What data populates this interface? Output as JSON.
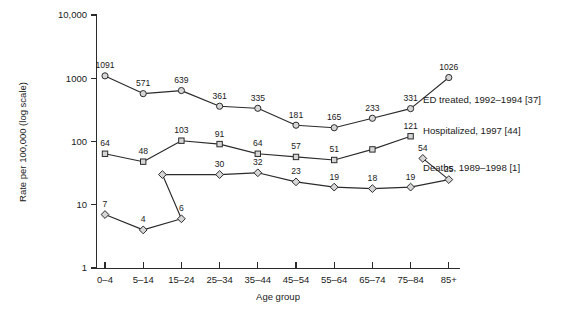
{
  "chart_data": {
    "type": "line",
    "title": "",
    "subtitle": "",
    "xlabel": "Age group",
    "ylabel": "Rate per 100,000 (log scale)",
    "yscale": "log",
    "ylim": [
      1,
      10000
    ],
    "grid": false,
    "legend_position": "right-inline",
    "categories": [
      "0–4",
      "5–14",
      "15–24",
      "25–34",
      "35–44",
      "45–54",
      "55–64",
      "65–74",
      "75–84",
      "85+"
    ],
    "ytick_labels": [
      "1",
      "10",
      "100",
      "1000",
      "10,000"
    ],
    "ytick_values": [
      1,
      10,
      100,
      1000,
      10000
    ],
    "series": [
      {
        "name": "ED treated, 1992–1994 [37]",
        "marker": "circle",
        "legend_label": "ED treated, 1992–1994 [37]",
        "x": [
          "0–4",
          "5–14",
          "15–24",
          "25–34",
          "35–44",
          "45–54",
          "55–64",
          "65–74",
          "75–84",
          "85+"
        ],
        "values": [
          1091,
          571,
          639,
          361,
          335,
          181,
          165,
          233,
          331,
          1026
        ],
        "labels": [
          "1091",
          "571",
          "639",
          "361",
          "335",
          "181",
          "165",
          "233",
          "331",
          "1026"
        ]
      },
      {
        "name": "Hospitalized, 1997 [44]",
        "marker": "square",
        "legend_label": "Hospitalized, 1997 [44]",
        "x": [
          "0–4",
          "5–14",
          "15–24",
          "25–34",
          "35–44",
          "45–54",
          "55–64",
          "65–74",
          "75–84"
        ],
        "values": [
          64,
          48,
          103,
          91,
          64,
          57,
          51,
          75,
          121
        ],
        "labels": [
          "64",
          "48",
          "103",
          "91",
          "64",
          "57",
          "51",
          "",
          "121"
        ]
      },
      {
        "name": "Deaths, 1989–1998 [1]",
        "marker": "diamond",
        "legend_label": "Deaths, 1989–1998 [1]",
        "x": [
          "0–4",
          "5–14",
          "15–24",
          "25–34",
          "35–44",
          "45–54",
          "55–64",
          "65–74",
          "75–84",
          "85+"
        ],
        "values": [
          7,
          4,
          6,
          30,
          32,
          23,
          19,
          18,
          19,
          25
        ],
        "labels": [
          "7",
          "4",
          "6",
          "30",
          "32",
          "23",
          "19",
          "18",
          "19",
          "25"
        ]
      }
    ],
    "extra_points": [
      {
        "series": "Deaths, 1989–1998 [1]",
        "label": "54",
        "value": 54
      }
    ]
  },
  "colors": {
    "axis": "#2b2b2b",
    "line": "#2b2b2b",
    "marker_fill": "#d6d6d6",
    "text": "#1a1a1a",
    "background": "#ffffff"
  }
}
